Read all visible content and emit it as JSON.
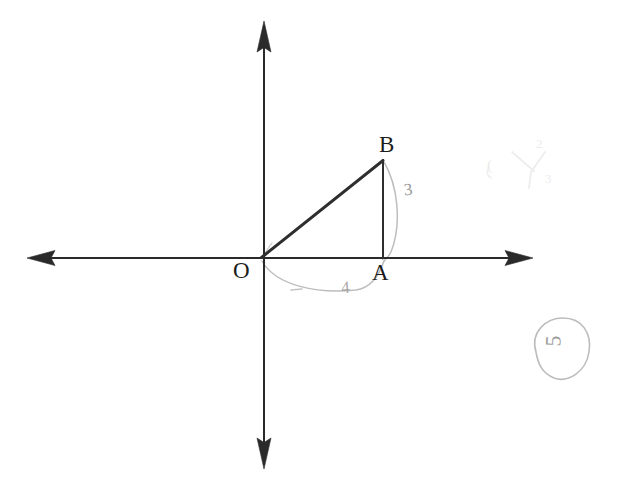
{
  "figure": {
    "kind": "hand-drawn-coordinate-diagram",
    "medium": "scanned pencil and pen on white paper",
    "canvas": {
      "width": 617,
      "height": 494
    },
    "background_color": "#ffffff",
    "ink_color": "#2b2b2b",
    "faint_pencil_color": "#a8a8a8",
    "erased_pencil_color": "#ececec"
  },
  "axes": {
    "origin": {
      "x": 260,
      "y": 258
    },
    "x_axis": {
      "name": "horizontal-axis",
      "from": {
        "x": 28,
        "y": 258
      },
      "to": {
        "x": 532,
        "y": 258
      },
      "arrow_left": true,
      "arrow_right": true
    },
    "y_axis": {
      "name": "vertical-axis",
      "from": {
        "x": 264,
        "y": 466
      },
      "to": {
        "x": 264,
        "y": 22
      },
      "arrow_up": true,
      "arrow_down": true
    }
  },
  "points": [
    {
      "id": "O",
      "label": "O",
      "x": 260,
      "y": 258,
      "label_x": 233,
      "label_y": 259,
      "note": "origin"
    },
    {
      "id": "A",
      "label": "A",
      "x": 383,
      "y": 258,
      "label_x": 372,
      "label_y": 261,
      "note": "foot on x-axis"
    },
    {
      "id": "B",
      "label": "B",
      "x": 383,
      "y": 160,
      "label_x": 379,
      "label_y": 133,
      "note": "apex above A"
    }
  ],
  "segments": [
    {
      "id": "OB",
      "name": "hypotenuse-ob",
      "from": "O",
      "to": "B",
      "style": "solid-dark"
    },
    {
      "id": "AB",
      "name": "vertical-leg-ab",
      "from": "A",
      "to": "B",
      "style": "solid-dark"
    }
  ],
  "annotations": {
    "ab_side_note": "3",
    "oa_side_note": "4",
    "circled_mark": "5",
    "erased_note_1": "(",
    "erased_note_2": "2",
    "erased_note_3": "3"
  },
  "faint_marks": {
    "arc_under_oa": "faint pencil arc sweeping from O below the x-axis up to A",
    "arc_beside_ab": "faint pencil arc bowing right of segment AB from B down to A",
    "small_dash": "short faint pencil dash below the x-axis near x=295",
    "circle_outline": "faint pencil oval enclosing the mark in the lower right"
  }
}
